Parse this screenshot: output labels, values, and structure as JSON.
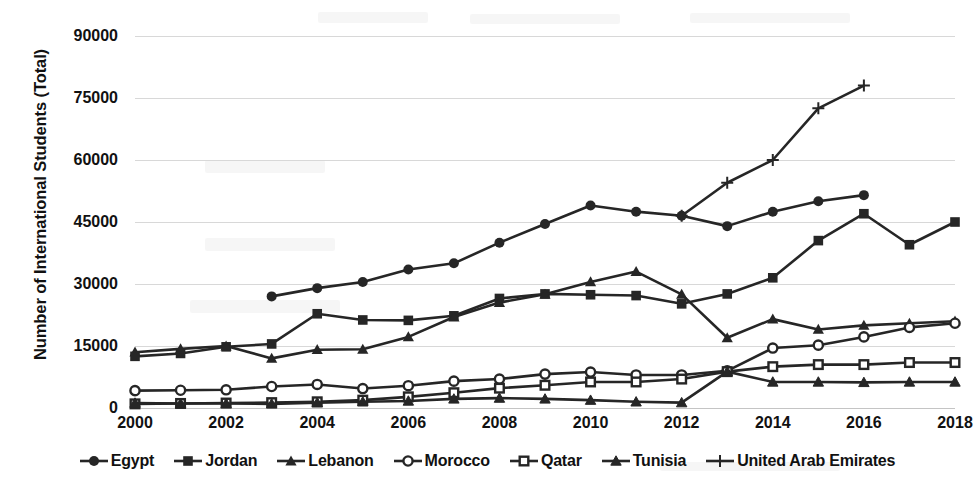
{
  "chart_data": {
    "type": "line",
    "title": "",
    "xlabel": "",
    "ylabel": "Number of International Students (Total)",
    "xlim": [
      2000,
      2018
    ],
    "ylim": [
      0,
      90000
    ],
    "y_ticks": [
      0,
      15000,
      30000,
      45000,
      60000,
      75000,
      90000
    ],
    "y_tick_labels": [
      "0",
      "15000",
      "30000",
      "45000",
      "60000",
      "75000",
      "90000"
    ],
    "x_ticks": [
      2000,
      2002,
      2004,
      2006,
      2008,
      2010,
      2012,
      2014,
      2016,
      2018
    ],
    "x_tick_labels": [
      "2000",
      "2002",
      "2004",
      "2006",
      "2008",
      "2010",
      "2012",
      "2014",
      "2016",
      "2018"
    ],
    "grid": true,
    "legend_position": "bottom",
    "line_color": "#262626",
    "series": [
      {
        "name": "Egypt",
        "marker": "filled-circle",
        "x": [
          2003,
          2004,
          2005,
          2006,
          2007,
          2008,
          2009,
          2010,
          2011,
          2012,
          2013,
          2014,
          2015,
          2016
        ],
        "values": [
          27000,
          29000,
          30500,
          33500,
          35000,
          40000,
          44500,
          49000,
          47500,
          46500,
          44000,
          47500,
          50000,
          51500
        ]
      },
      {
        "name": "Jordan",
        "marker": "filled-square",
        "x": [
          2000,
          2001,
          2002,
          2003,
          2004,
          2005,
          2006,
          2007,
          2008,
          2009,
          2010,
          2011,
          2012,
          2013,
          2014,
          2015,
          2016,
          2017,
          2018
        ],
        "values": [
          12500,
          13200,
          14800,
          15500,
          22800,
          21300,
          21200,
          22300,
          26500,
          27600,
          27400,
          27200,
          25200,
          27600,
          31500,
          40500,
          47000,
          39500,
          45000
        ]
      },
      {
        "name": "Lebanon",
        "marker": "filled-triangle",
        "x": [
          2000,
          2001,
          2002,
          2003,
          2004,
          2005,
          2006,
          2007,
          2008,
          2009,
          2010,
          2011,
          2012,
          2013,
          2014,
          2015,
          2016,
          2017,
          2018
        ],
        "values": [
          13500,
          14300,
          15000,
          12000,
          14100,
          14200,
          17200,
          22000,
          25500,
          27500,
          30500,
          33000,
          27500,
          17000,
          21500,
          19000,
          20000,
          20500,
          21000
        ]
      },
      {
        "name": "Morocco",
        "marker": "open-circle",
        "x": [
          2000,
          2001,
          2002,
          2003,
          2004,
          2005,
          2006,
          2007,
          2008,
          2009,
          2010,
          2011,
          2012,
          2013,
          2014,
          2015,
          2016,
          2017,
          2018
        ],
        "values": [
          4200,
          4300,
          4400,
          5200,
          5700,
          4700,
          5400,
          6500,
          7000,
          8200,
          8700,
          8000,
          8000,
          9000,
          14500,
          15200,
          17200,
          19500,
          20500
        ]
      },
      {
        "name": "Qatar",
        "marker": "open-square",
        "x": [
          2000,
          2001,
          2002,
          2003,
          2004,
          2005,
          2006,
          2007,
          2008,
          2009,
          2010,
          2011,
          2012,
          2013,
          2014,
          2015,
          2016,
          2017,
          2018
        ],
        "values": [
          1000,
          1100,
          1200,
          1300,
          1500,
          1900,
          2700,
          3700,
          4800,
          5500,
          6300,
          6300,
          7000,
          8800,
          10000,
          10500,
          10500,
          11000,
          11000
        ]
      },
      {
        "name": "Tunisia",
        "marker": "filled-triangle-small",
        "x": [
          2000,
          2001,
          2002,
          2003,
          2004,
          2005,
          2006,
          2007,
          2008,
          2009,
          2010,
          2011,
          2012,
          2013,
          2014,
          2015,
          2016,
          2017,
          2018
        ],
        "values": [
          1200,
          1100,
          1100,
          1000,
          1300,
          1500,
          1700,
          2200,
          2400,
          2200,
          1900,
          1500,
          1300,
          8800,
          6300,
          6300,
          6200,
          6300,
          6300
        ]
      },
      {
        "name": "United Arab Emirates",
        "marker": "plus",
        "x": [
          2012,
          2013,
          2014,
          2015,
          2016
        ],
        "values": [
          46500,
          54500,
          60000,
          72500,
          78000
        ]
      }
    ]
  },
  "legend": {
    "items": [
      {
        "label": "Egypt",
        "marker": "filled-circle"
      },
      {
        "label": "Jordan",
        "marker": "filled-square"
      },
      {
        "label": "Lebanon",
        "marker": "filled-triangle"
      },
      {
        "label": "Morocco",
        "marker": "open-circle"
      },
      {
        "label": "Qatar",
        "marker": "open-square"
      },
      {
        "label": "Tunisia",
        "marker": "filled-triangle-small"
      },
      {
        "label": "United Arab Emirates",
        "marker": "plus"
      }
    ]
  }
}
